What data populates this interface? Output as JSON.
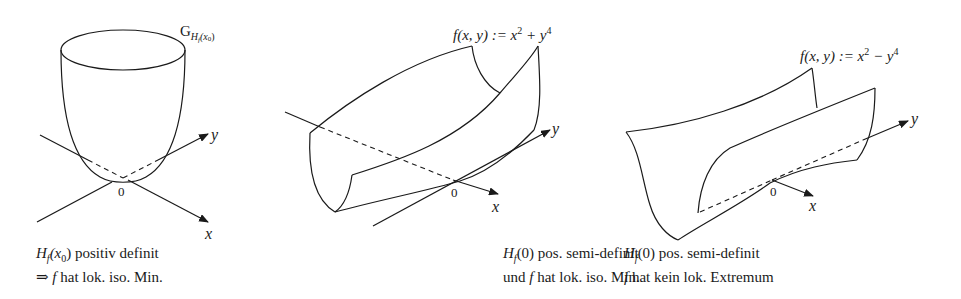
{
  "figure": {
    "panels": [
      {
        "id": "positive-definite",
        "graph_label": "G",
        "graph_label_sub": "H",
        "graph_label_subsub": "f",
        "graph_label_arg": "(x",
        "graph_label_arg_sub": "0",
        "graph_label_close": ")",
        "axis_x": "x",
        "axis_y": "y",
        "origin": "0",
        "caption": {
          "line1_H": "H",
          "line1_sub": "f",
          "line1_arg": "(x",
          "line1_arg_sub": "0",
          "line1_rest": ") positiv definit",
          "line2_arrow": "⇒ ",
          "line2_f": "f",
          "line2_rest": " hat lok. iso. Min."
        }
      },
      {
        "id": "semi-definite-min",
        "formula_prefix": "f(x, y) := x",
        "formula_exp1": "2",
        "formula_mid": " + y",
        "formula_exp2": "4",
        "axis_x": "x",
        "axis_y": "y",
        "origin": "0",
        "caption": {
          "line1_H": "H",
          "line1_sub": "f",
          "line1_rest": "(0) pos. semi-definit",
          "line2_pre": "und ",
          "line2_f": "f",
          "line2_rest": " hat lok. iso. Min."
        }
      },
      {
        "id": "semi-definite-no-extremum",
        "formula_prefix": "f(x, y) := x",
        "formula_exp1": "2",
        "formula_mid": " − y",
        "formula_exp2": "4",
        "axis_x": "x",
        "axis_y": "y",
        "origin": "0",
        "caption": {
          "line1_H": "H",
          "line1_sub": "f",
          "line1_rest": "(0) pos. semi-definit",
          "line2_f": "f",
          "line2_rest": " hat kein lok. Extremum"
        }
      }
    ]
  }
}
